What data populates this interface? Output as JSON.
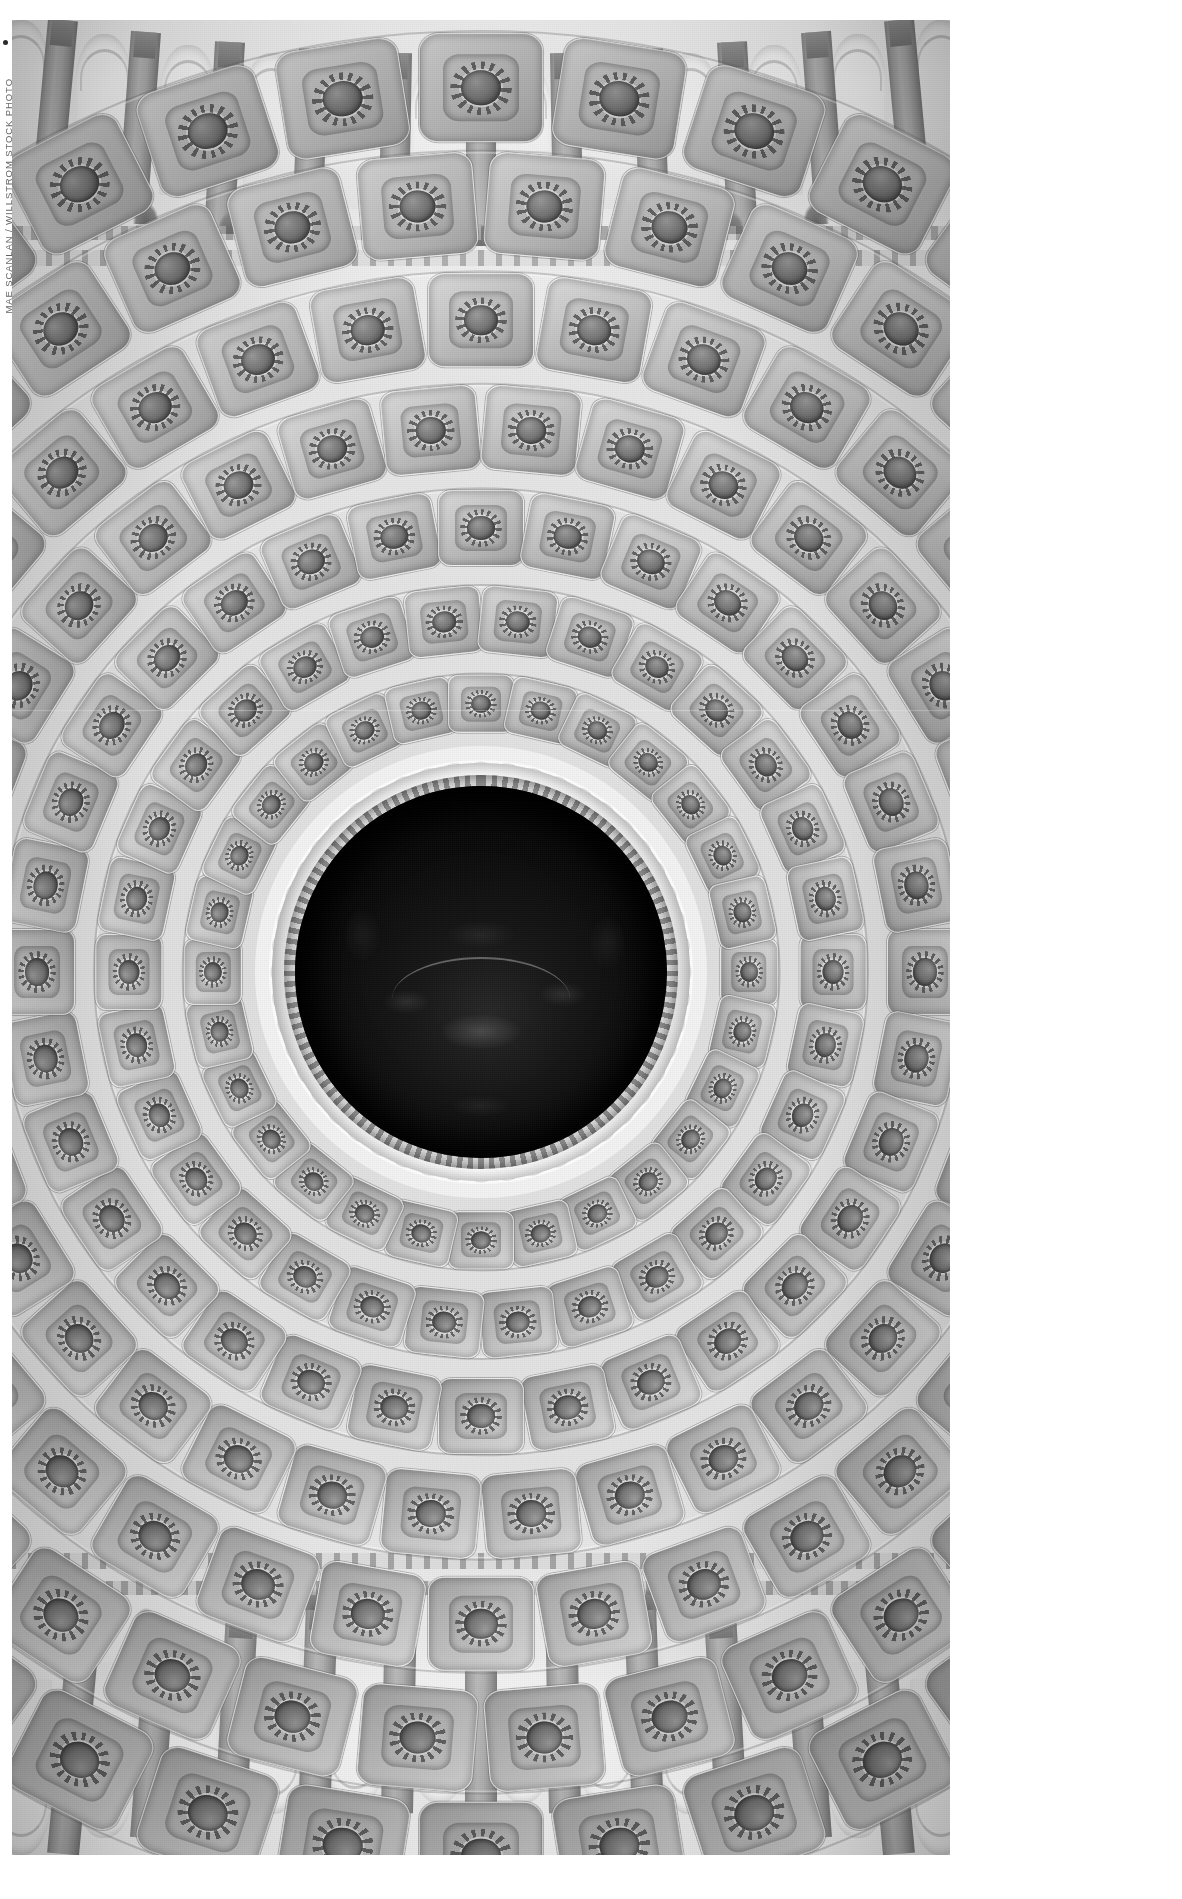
{
  "page": {
    "background_color": "#ffffff",
    "width": 1182,
    "height": 1899
  },
  "credit": {
    "text": "MAE SCANLAN / WILLSTROM STOCK PHOTO",
    "orientation": "vertical-rotated-90ccw",
    "color": "#4a4a4a"
  },
  "photograph": {
    "subject": "United States Capitol Rotunda dome interior, viewed from below",
    "treatment": "black-and-white",
    "frame": {
      "left": 12,
      "top": 20,
      "width": 938,
      "height": 1835
    },
    "colors": {
      "coffer_light": "#d7d7d7",
      "coffer_mid": "#b0b0b0",
      "coffer_shadow": "#6e6e6e",
      "column_gray": "#9a9a9a",
      "window_white": "#ffffff",
      "oculus_dark": "#0a0a0a",
      "star_disc": "#e0e0e0",
      "star_fill": "#3a3a3a"
    },
    "elements": {
      "oculus_label": "oculus-fresco",
      "fresco_label": "apotheosis-of-washington",
      "star_ring_label": "star-medallion-ring",
      "coffer_rings": 7,
      "coffers_per_ring": [
        28,
        30,
        32,
        34,
        36,
        38,
        40
      ],
      "star_count": 48,
      "columns_top": 13,
      "columns_bottom": 13,
      "windows_top": 12,
      "windows_bottom": 12
    }
  }
}
